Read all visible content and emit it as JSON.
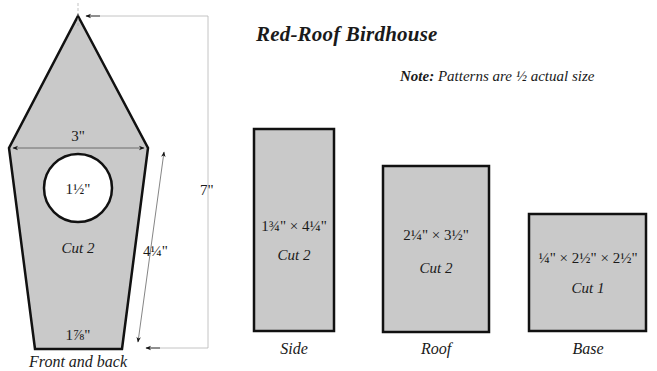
{
  "title": "Red-Roof Birdhouse",
  "note": {
    "label": "Note:",
    "text": "Patterns are ½ actual size"
  },
  "colors": {
    "panel_fill": "#c9c9c9",
    "outline": "#111111",
    "dimension_line": "#9a9a9a"
  },
  "pieces": {
    "front_back": {
      "label": "Front and back",
      "cut": "Cut 2",
      "width_dim": "3\"",
      "hole_dim": "1½\"",
      "side_dim": "4¼\"",
      "height_dim": "7\"",
      "bottom_dim": "1⅞\""
    },
    "side": {
      "label": "Side",
      "dims": "1¾\" × 4¼\"",
      "cut": "Cut 2"
    },
    "roof": {
      "label": "Roof",
      "dims": "2¼\" × 3½\"",
      "cut": "Cut 2"
    },
    "base": {
      "label": "Base",
      "dims": "¼\" × 2½\" × 2½\"",
      "cut": "Cut 1"
    }
  }
}
